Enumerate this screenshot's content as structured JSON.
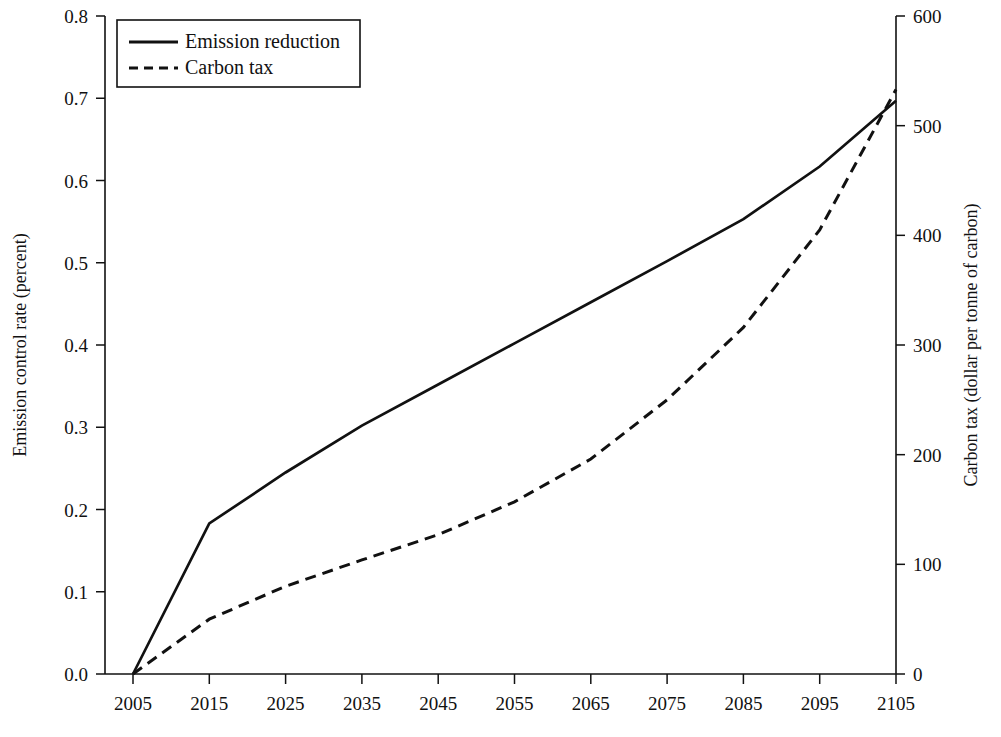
{
  "chart_data": {
    "type": "line",
    "title": "",
    "xlabel": "",
    "ylabel": "Emission control rate (percent)",
    "y2label": "Carbon tax (dollar per tonne of carbon)",
    "grid": false,
    "legend_position": "top-left",
    "x": [
      2005,
      2015,
      2025,
      2035,
      2045,
      2055,
      2065,
      2075,
      2085,
      2095,
      2105
    ],
    "xlim": [
      2005,
      2105
    ],
    "xticks": [
      "2005",
      "2015",
      "2025",
      "2035",
      "2045",
      "2055",
      "2065",
      "2075",
      "2085",
      "2095",
      "2105"
    ],
    "ylim": [
      0.0,
      0.8
    ],
    "yticks": [
      "0.0",
      "0.1",
      "0.2",
      "0.3",
      "0.4",
      "0.5",
      "0.6",
      "0.7",
      "0.8"
    ],
    "y2lim": [
      0,
      600
    ],
    "y2ticks": [
      "0",
      "100",
      "200",
      "300",
      "400",
      "500",
      "600"
    ],
    "series": [
      {
        "name": "Emission reduction",
        "axis": "left",
        "style": "solid",
        "color": "#111111",
        "values": [
          0.0,
          0.183,
          0.245,
          0.302,
          0.352,
          0.402,
          0.452,
          0.502,
          0.553,
          0.617,
          0.697
        ]
      },
      {
        "name": "Carbon tax",
        "axis": "right",
        "style": "dashed",
        "color": "#111111",
        "values": [
          0,
          50,
          80,
          104,
          127,
          157,
          196,
          250,
          316,
          405,
          533
        ]
      }
    ]
  },
  "legend": {
    "items": [
      {
        "label": "Emission reduction",
        "style": "solid"
      },
      {
        "label": "Carbon tax",
        "style": "dashed"
      }
    ]
  },
  "axes": {
    "left_title": "Emission control rate (percent)",
    "right_title": "Carbon tax (dollar per tonne of carbon)"
  }
}
